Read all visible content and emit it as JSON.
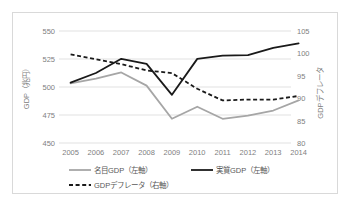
{
  "chart_data": {
    "type": "line",
    "title": "",
    "xlabel": "",
    "ylabel": "GDP（兆円）",
    "y2label": "GDPデフレータ",
    "categories": [
      "2005",
      "2006",
      "2007",
      "2008",
      "2009",
      "2010",
      "2011",
      "2012",
      "2013",
      "2014"
    ],
    "ylim": [
      450,
      550
    ],
    "yticks": [
      450,
      475,
      500,
      525,
      550
    ],
    "y2lim": [
      80,
      105
    ],
    "y2ticks": [
      80,
      85,
      90,
      95,
      100,
      105
    ],
    "grid": true,
    "legend_position": "bottom",
    "series": [
      {
        "name": "名目GDP（左軸）",
        "axis": "left",
        "style": "solid",
        "color": "#a6a6a6",
        "values": [
          503.2,
          507.4,
          513.0,
          501.2,
          471.6,
          482.4,
          471.6,
          474.5,
          479.0,
          488.0
        ]
      },
      {
        "name": "実質GDP（左軸）",
        "axis": "left",
        "style": "solid",
        "color": "#1a1a1a",
        "values": [
          503.9,
          512.5,
          525.2,
          520.7,
          493.0,
          525.1,
          528.0,
          528.5,
          535.0,
          539.0
        ]
      },
      {
        "name": "GDPデフレータ（右軸）",
        "axis": "right",
        "style": "dashed",
        "color": "#1a1a1a",
        "values": [
          99.8,
          98.7,
          97.6,
          96.2,
          95.6,
          92.1,
          89.5,
          89.7,
          89.7,
          90.5
        ]
      }
    ]
  },
  "legend": {
    "items": [
      {
        "label": "名目GDP（左軸）",
        "style": "solid",
        "color": "#a6a6a6"
      },
      {
        "label": "実質GDP（左軸）",
        "style": "solid",
        "color": "#1a1a1a"
      },
      {
        "label": "GDPデフレータ（右軸）",
        "style": "dashed",
        "color": "#1a1a1a"
      }
    ]
  },
  "axes": {
    "left_title": "GDP（兆円）",
    "right_title": "GDPデフレータ",
    "left_ticks": [
      "550",
      "525",
      "500",
      "475",
      "450"
    ],
    "right_ticks": [
      "105",
      "100",
      "95",
      "90",
      "85",
      "80"
    ],
    "x_ticks": [
      "2005",
      "2006",
      "2007",
      "2008",
      "2009",
      "2010",
      "2011",
      "2012",
      "2013",
      "2014"
    ]
  },
  "colors": {
    "nominal": "#a6a6a6",
    "real": "#1a1a1a",
    "deflator": "#1a1a1a",
    "grid": "#d9d9d9",
    "tick_text": "#808080",
    "legend_text": "#595959",
    "frame": "#d9d9d9"
  }
}
